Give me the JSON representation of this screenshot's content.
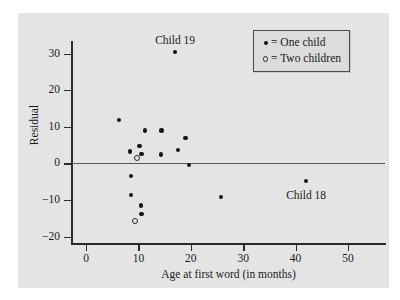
{
  "chart_data": {
    "type": "scatter",
    "title": "",
    "xlabel": "Age at first word (in months)",
    "ylabel": "Residual",
    "xlim": [
      -3,
      57
    ],
    "ylim": [
      -22.5,
      35
    ],
    "xticks": [
      0,
      10,
      20,
      30,
      40,
      50
    ],
    "yticks": [
      30,
      20,
      10,
      0,
      -10,
      -20
    ],
    "xtick_labels": [
      "0",
      "10",
      "20",
      "30",
      "40",
      "50"
    ],
    "ytick_labels": [
      "30",
      "20",
      "10",
      "0",
      "−10",
      "−20"
    ],
    "grid": false,
    "reference_line": {
      "axis": "y",
      "value": 0
    },
    "legend": {
      "position": "top-right",
      "entries": [
        {
          "marker": "filled-dot",
          "label": "= One child"
        },
        {
          "marker": "open-circle",
          "label": "= Two children"
        }
      ]
    },
    "series": [
      {
        "name": "One child",
        "marker": "filled-dot",
        "points": [
          {
            "x": 6.3,
            "y": 11.8
          },
          {
            "x": 17.0,
            "y": 30.4
          },
          {
            "x": 8.4,
            "y": 3.3
          },
          {
            "x": 10.2,
            "y": 4.8
          },
          {
            "x": 10.6,
            "y": 2.6
          },
          {
            "x": 11.3,
            "y": 9.0
          },
          {
            "x": 14.4,
            "y": 9.0
          },
          {
            "x": 14.3,
            "y": 2.4
          },
          {
            "x": 17.5,
            "y": 3.7
          },
          {
            "x": 19.0,
            "y": 7.0
          },
          {
            "x": 19.7,
            "y": -0.4
          },
          {
            "x": 8.6,
            "y": -3.5
          },
          {
            "x": 8.6,
            "y": -8.6
          },
          {
            "x": 10.5,
            "y": -11.5
          },
          {
            "x": 10.6,
            "y": -13.8
          },
          {
            "x": 25.7,
            "y": -9.1
          },
          {
            "x": 42.0,
            "y": -4.8
          }
        ]
      },
      {
        "name": "Two children",
        "marker": "open-circle",
        "points": [
          {
            "x": 9.6,
            "y": 1.8
          },
          {
            "x": 9.1,
            "y": -15.5
          }
        ]
      }
    ],
    "annotations": [
      {
        "text": "Child 19",
        "x": 17.0,
        "y": 33.5
      },
      {
        "text": "Child 18",
        "x": 42.0,
        "y": -9.0
      }
    ]
  },
  "colors": {
    "panel_background": "#e4e4e4",
    "figure_background": "#ffffff",
    "axis": "#2b2b2b",
    "reference_line": "#5a5a5a",
    "marker": "#151515",
    "legend_background": "#dcdcdc",
    "legend_border": "#4a4a4a",
    "text": "#1a1a1a"
  }
}
